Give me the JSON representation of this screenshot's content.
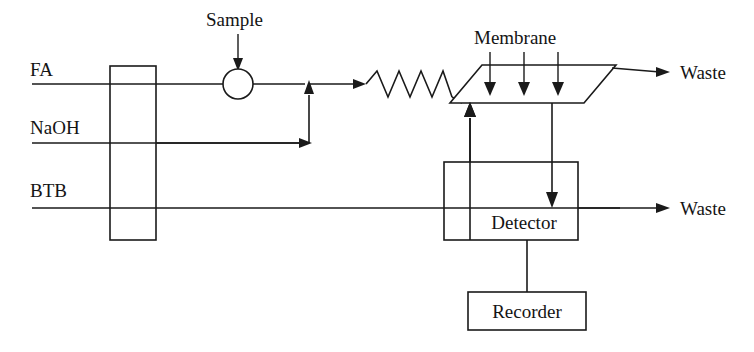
{
  "diagram": {
    "type": "process-flow-diagram",
    "colors": {
      "stroke": "#1a1a1a",
      "text": "#141414",
      "background": "#ffffff"
    },
    "reagent_lines": [
      {
        "id": "fa",
        "label": "FA",
        "label_x": 30,
        "label_y": 76,
        "line_y": 84,
        "line_x_start": 32,
        "line_x_end": 305
      },
      {
        "id": "naoh",
        "label": "NaOH",
        "label_x": 30,
        "label_y": 134,
        "line_y": 143,
        "line_x_start": 32,
        "line_x_end": 305
      },
      {
        "id": "btb",
        "label": "BTB",
        "label_x": 30,
        "label_y": 197,
        "line_y": 208,
        "line_x_start": 32,
        "line_x_end": 620
      }
    ],
    "pump": {
      "name": "peristaltic-pump",
      "x": 110,
      "y": 66,
      "width": 46,
      "height": 174
    },
    "injection_valve": {
      "name": "sample-injection-port",
      "label": "Sample",
      "label_x": 206,
      "label_y": 26,
      "arrow_x": 238,
      "arrow_y_start": 34,
      "arrow_y_end": 68,
      "circle_cx": 238,
      "circle_cy": 84,
      "circle_r": 15
    },
    "mixing_coil": {
      "name": "mixing-coil",
      "peaks": 4,
      "x_start": 366,
      "x_end": 452,
      "y_center": 84,
      "amplitude": 13
    },
    "membrane": {
      "name": "gas-diffusion-membrane-unit",
      "label": "Membrane",
      "label_x": 474,
      "label_y": 44,
      "polygon": "482,65 616,65 584,103 450,103",
      "donor_arrows": [
        {
          "x": 490,
          "y_start": 52,
          "y_end": 95
        },
        {
          "x": 524,
          "y_start": 52,
          "y_end": 95
        },
        {
          "x": 558,
          "y_start": 52,
          "y_end": 95
        }
      ]
    },
    "detector": {
      "name": "detector-unit",
      "label": "Detector",
      "x": 444,
      "y": 162,
      "width": 134,
      "height": 78,
      "label_x": 524,
      "label_y": 222
    },
    "recorder": {
      "name": "recorder-unit",
      "label": "Recorder",
      "x": 468,
      "y": 292,
      "width": 118,
      "height": 38,
      "label_x": 527,
      "label_y": 318
    },
    "outputs": [
      {
        "id": "waste-top",
        "label": "Waste",
        "label_x": 672,
        "label_y": 79,
        "line_y": 72,
        "line_x_start": 612,
        "line_x_end": 662
      },
      {
        "id": "waste-bottom",
        "label": "Waste",
        "label_x": 672,
        "label_y": 215,
        "line_y": 208,
        "line_x_start": 578,
        "line_x_end": 662
      }
    ],
    "connectors": [
      {
        "id": "naoh-to-fa-riser",
        "description": "NaOH stream rises to merge with FA stream at confluence point"
      },
      {
        "id": "btb-to-membrane",
        "description": "BTB acceptor stream rises into membrane acceptor channel"
      },
      {
        "id": "membrane-to-detector",
        "description": "Acceptor stream descends from membrane into detector flow cell"
      },
      {
        "id": "detector-to-recorder",
        "description": "Detector signal routed to recorder"
      }
    ]
  }
}
